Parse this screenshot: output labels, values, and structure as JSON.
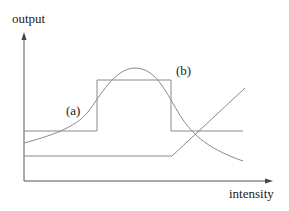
{
  "diagram": {
    "y_axis_label": "output",
    "x_axis_label": "intensity",
    "curve_labels": {
      "a": "(a)",
      "b": "(b)"
    },
    "curves": [
      {
        "id": "rectangular",
        "description": "step/rectangular response"
      },
      {
        "id": "gaussian",
        "description": "bell-shaped response labeled (a)"
      },
      {
        "id": "ramp",
        "description": "flat then rising linear response"
      }
    ],
    "colors": {
      "curve": "#8a8a8a",
      "axis": "#555555",
      "text": "#222222"
    }
  }
}
